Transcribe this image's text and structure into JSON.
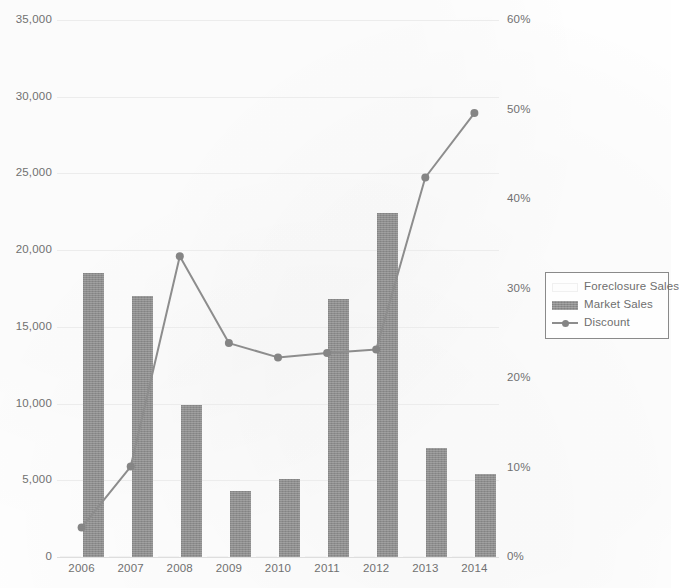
{
  "chart_data": {
    "type": "bar",
    "title": "",
    "subtitle": "",
    "xlabel": "",
    "ylabel": "",
    "categories": [
      "2006",
      "2007",
      "2008",
      "2009",
      "2010",
      "2011",
      "2012",
      "2013",
      "2014"
    ],
    "grid": true,
    "legend_position": "right",
    "primary_axis": {
      "label": "",
      "ylim": [
        0,
        35000
      ],
      "tick_values": [
        0,
        5000,
        10000,
        15000,
        20000,
        25000,
        30000,
        35000
      ],
      "tick_labels": [
        "0",
        "5,000",
        "10,000",
        "15,000",
        "20,000",
        "25,000",
        "30,000",
        "35,000"
      ]
    },
    "secondary_axis": {
      "label": "",
      "ylim": [
        0,
        60
      ],
      "tick_values": [
        0,
        10,
        20,
        30,
        40,
        50,
        60
      ],
      "tick_labels": [
        "0%",
        "10%",
        "20%",
        "30%",
        "40%",
        "50%",
        "60%"
      ]
    },
    "series": [
      {
        "name": "Foreclosure Sales",
        "type": "bar",
        "axis": "primary",
        "color": "#fdfdfd",
        "values": [
          0,
          0,
          0,
          0,
          0,
          0,
          0,
          0,
          0
        ]
      },
      {
        "name": "Market Sales",
        "type": "bar",
        "axis": "primary",
        "color": "#8d8d8d",
        "values": [
          18500,
          17000,
          9900,
          4300,
          5100,
          16800,
          22400,
          7100,
          5400
        ]
      },
      {
        "name": "Discount",
        "type": "line",
        "axis": "secondary",
        "color": "#8d8d8d",
        "marker": "circle",
        "values": [
          3.3,
          10.1,
          33.6,
          23.9,
          22.3,
          22.8,
          23.2,
          42.4,
          49.6
        ]
      }
    ]
  },
  "legend": {
    "items": [
      {
        "label": "Foreclosure Sales",
        "swatch": "bar-white"
      },
      {
        "label": "Market Sales",
        "swatch": "bar-gray"
      },
      {
        "label": "Discount",
        "swatch": "line-marker"
      }
    ]
  }
}
